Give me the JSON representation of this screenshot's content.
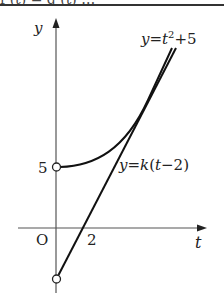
{
  "header": {
    "cut_text": "f (t) = g (t) …"
  },
  "diagram": {
    "axis_labels": {
      "vertical": "y",
      "horizontal": "t",
      "origin": "O"
    },
    "ticks": {
      "y_intercept": "5",
      "t_intercept": "2"
    },
    "curves": [
      {
        "name": "parabola",
        "label": "y=t²+5",
        "equation": "y = t^2 + 5",
        "domain": "t > 0",
        "open_endpoint": [
          0,
          5
        ]
      },
      {
        "name": "tangent-line",
        "label": "y=k(t−2)",
        "equation": "y = k(t - 2)",
        "domain": "t > 0",
        "open_endpoint": [
          0,
          "-2k"
        ],
        "t_intercept": 2
      }
    ],
    "colors": {
      "ink": "#222222",
      "axis": "#555555",
      "background": "#ffffff"
    }
  }
}
